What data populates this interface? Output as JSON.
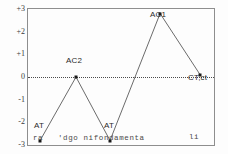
{
  "chart_data": {
    "type": "line",
    "title": "",
    "subtitle": "",
    "xlabel": "",
    "ylabel": "",
    "grid": false,
    "legend_position": "none",
    "ylim": [
      -3,
      3
    ],
    "yticks": [
      "+3",
      "+2",
      "+1",
      "0",
      "-1",
      "-2",
      "-3"
    ],
    "ytick_values": [
      3,
      2,
      1,
      0,
      -1,
      -2,
      -3
    ],
    "zero_line": {
      "value": 0,
      "style": "dotted"
    },
    "x": [
      1,
      2,
      3,
      4,
      5
    ],
    "series": [
      {
        "name": "",
        "values": [
          -2.8,
          0.0,
          -2.8,
          2.8,
          0.1
        ],
        "point_labels": [
          "AT",
          "AC2",
          "AT",
          "AC1",
          "CT,ct"
        ],
        "label_positions": [
          "below",
          "above",
          "below",
          "above",
          "below-right"
        ]
      }
    ],
    "annotations": [
      {
        "text": "AT",
        "x": 1,
        "y": -2.8
      },
      {
        "text": "AC2",
        "x": 2,
        "y": 0.0
      },
      {
        "text": "AT",
        "x": 3,
        "y": -2.8
      },
      {
        "text": "AC1",
        "x": 4,
        "y": 2.8
      },
      {
        "text": "CT,ct",
        "x": 5,
        "y": 0.1
      }
    ],
    "x_axis_caption_fragments": [
      "ra",
      "'dgo nifondamenta",
      "li"
    ]
  },
  "colors": {
    "frame": "#8e8e8e",
    "line": "#5a5a5a",
    "marker": "#1a1a1a",
    "zero_line": "#4a4a4a",
    "text": "#2b2b2b",
    "background": "#fdfdfd"
  }
}
